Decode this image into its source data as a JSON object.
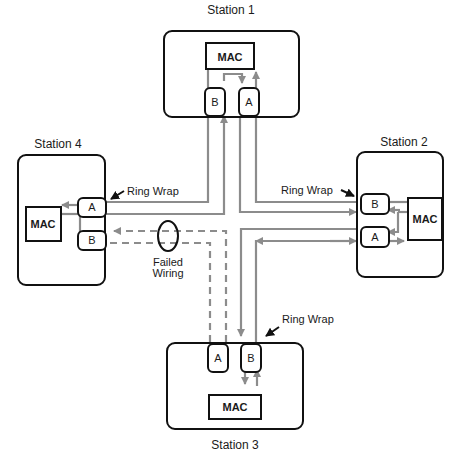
{
  "colors": {
    "outline": "#111111",
    "wire": "#8c8c8c",
    "text": "#1a1a1a",
    "background": "#ffffff"
  },
  "stations": [
    {
      "id": "station-1",
      "label": "Station 1",
      "mac": "MAC",
      "ports": [
        "B",
        "A"
      ]
    },
    {
      "id": "station-2",
      "label": "Station 2",
      "mac": "MAC",
      "ports": [
        "B",
        "A"
      ]
    },
    {
      "id": "station-3",
      "label": "Station 3",
      "mac": "MAC",
      "ports": [
        "A",
        "B"
      ]
    },
    {
      "id": "station-4",
      "label": "Station 4",
      "mac": "MAC",
      "ports": [
        "A",
        "B"
      ]
    }
  ],
  "annotations": {
    "ring_wrap_station4": "Ring Wrap",
    "ring_wrap_station2": "Ring Wrap",
    "ring_wrap_station3": "Ring Wrap",
    "failed_wiring_line1": "Failed",
    "failed_wiring_line2": "Wiring"
  }
}
